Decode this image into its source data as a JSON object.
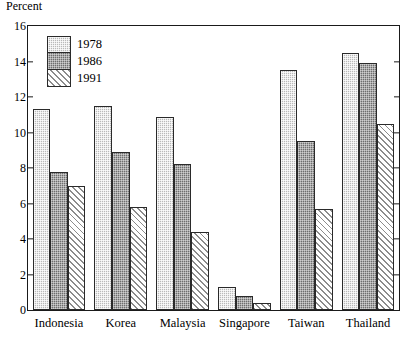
{
  "chart_data": {
    "type": "bar",
    "title": "",
    "subtitle": "",
    "xlabel": "",
    "ylabel": "Percent",
    "ylim": [
      0,
      16
    ],
    "ytick_step": 2,
    "yticks": [
      0,
      2,
      4,
      6,
      8,
      10,
      12,
      14,
      16
    ],
    "grid": false,
    "legend_position": "top-left inside plot",
    "categories": [
      "Indonesia",
      "Korea",
      "Malaysia",
      "Singapore",
      "Taiwan",
      "Thailand"
    ],
    "series": [
      {
        "name": "1978",
        "fill": "light-dotted",
        "color": "#b9b9b9",
        "values": [
          11.3,
          11.5,
          10.9,
          1.3,
          13.5,
          14.5
        ]
      },
      {
        "name": "1986",
        "fill": "dark-solid",
        "color": "#6e6e6e",
        "values": [
          7.8,
          8.9,
          8.2,
          0.8,
          9.5,
          13.9
        ]
      },
      {
        "name": "1991",
        "fill": "diagonal-hatch",
        "color": "#8c8c8c",
        "values": [
          7.0,
          5.8,
          4.4,
          0.4,
          5.7,
          10.5
        ]
      }
    ]
  },
  "axis": {
    "y_label": "Percent",
    "y_tick_labels": [
      "16",
      "14",
      "12",
      "10",
      "8",
      "6",
      "4",
      "2",
      "0"
    ]
  },
  "legend": {
    "entries": [
      {
        "label": "1978"
      },
      {
        "label": "1986"
      },
      {
        "label": "1991"
      }
    ]
  }
}
